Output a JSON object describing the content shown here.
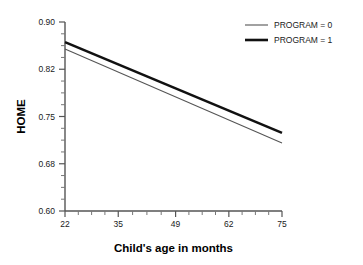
{
  "chart_data": {
    "type": "line",
    "title": "",
    "subtitle": "",
    "xlabel": "Child's age in months",
    "ylabel": "HOME",
    "xlim": [
      22,
      75
    ],
    "ylim": [
      0.6,
      0.9
    ],
    "xticks": [
      "22",
      "35",
      "49",
      "62",
      "75"
    ],
    "xtick_values": [
      22,
      35,
      49,
      62,
      75
    ],
    "yticks": [
      "0.60",
      "0.68",
      "0.75",
      "0.82",
      "0.90"
    ],
    "ytick_values": [
      0.6,
      0.68,
      0.75,
      0.82,
      0.9
    ],
    "x_minor_count": 3,
    "y_minor_count": 3,
    "grid": false,
    "legend_position": "top-right",
    "x": [
      22,
      75
    ],
    "series": [
      {
        "name": "PROGRAM = 0",
        "values": [
          0.857,
          0.708
        ],
        "color": "#555555",
        "linewidth": 1.1
      },
      {
        "name": "PROGRAM = 1",
        "values": [
          0.868,
          0.724
        ],
        "color": "#111111",
        "linewidth": 2.6
      }
    ]
  },
  "legend": {
    "entries": [
      {
        "label": "PROGRAM = 0"
      },
      {
        "label": "PROGRAM = 1"
      }
    ]
  },
  "axes": {
    "x_title": "Child's age in months",
    "y_title": "HOME"
  }
}
